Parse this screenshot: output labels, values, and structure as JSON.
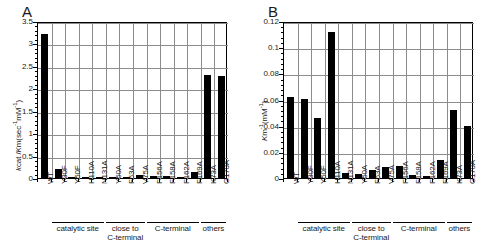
{
  "figure": {
    "panels": [
      {
        "letter": "A"
      },
      {
        "letter": "B"
      }
    ]
  },
  "chart_data": [
    {
      "type": "bar",
      "panel": "A",
      "title": "",
      "xlabel": "",
      "ylabel": "kcat /Km (sec-1 mM-1)",
      "ylabel_parts": {
        "pre_italic": "k",
        "pre_rest": "cat /",
        "mid_italic": "K",
        "mid_rest": "m (sec",
        "sup1": "-1",
        "mid2": "mM",
        "sup2": "-1",
        "tail": ")"
      },
      "ylim": [
        0,
        3.5
      ],
      "yticks": [
        "0",
        "0.5",
        "1",
        "1.5",
        "2",
        "2.5",
        "3",
        "3.5"
      ],
      "ytick_values": [
        0,
        0.5,
        1,
        1.5,
        2,
        2.5,
        3,
        3.5
      ],
      "grid": true,
      "legend": "none",
      "categories": [
        "WT",
        "Y30F",
        "Y50F",
        "H110A",
        "N131A",
        "Y50A",
        "F53A",
        "V75A",
        "F156A",
        "F158A",
        "F162A",
        "F169A",
        "K73A",
        "G170A"
      ],
      "values": [
        3.22,
        0.19,
        0.02,
        0.005,
        0.02,
        0.03,
        0.02,
        0.06,
        0.05,
        0.04,
        0.02,
        0.14,
        2.3,
        2.28
      ],
      "groups": [
        {
          "label": "catalytic site",
          "start": 1,
          "end": 4
        },
        {
          "label": "close to\nC-terminal",
          "start": 5,
          "end": 7
        },
        {
          "label": "C-terminal",
          "start": 8,
          "end": 11
        },
        {
          "label": "others",
          "start": 12,
          "end": 13
        }
      ]
    },
    {
      "type": "bar",
      "panel": "B",
      "title": "",
      "xlabel": "",
      "ylabel": "Km-1 (mM-1)",
      "ylabel_parts": {
        "italic": "K",
        "sub": "m",
        "sup1": "-1",
        "mid": "(mM",
        "sup2": "-1",
        "tail": ")"
      },
      "ylim": [
        0,
        0.12
      ],
      "yticks": [
        "0",
        "0.02",
        "0.04",
        "0.06",
        "0.08",
        "0.1",
        "0.12"
      ],
      "ytick_values": [
        0,
        0.02,
        0.04,
        0.06,
        0.08,
        0.1,
        0.12
      ],
      "grid": true,
      "legend": "none",
      "categories": [
        "WT",
        "Y30F",
        "Y50F",
        "H110A",
        "N131A",
        "Y50A",
        "F53A",
        "V75A",
        "F156A",
        "F158A",
        "F162A",
        "F169A",
        "K73A",
        "G170A"
      ],
      "values": [
        0.0622,
        0.0602,
        0.046,
        0.1118,
        0.0038,
        0.003,
        0.0062,
        0.0088,
        0.0094,
        0.0022,
        0.0018,
        0.0136,
        0.0518,
        0.04
      ],
      "groups": [
        {
          "label": "catalytic site",
          "start": 1,
          "end": 4
        },
        {
          "label": "close to\nC-terminal",
          "start": 5,
          "end": 7
        },
        {
          "label": "C-terminal",
          "start": 8,
          "end": 11
        },
        {
          "label": "others",
          "start": 12,
          "end": 13
        }
      ]
    }
  ],
  "colors": {
    "bar": "#000000",
    "grid": "#8c8c8c",
    "axis": "#000000",
    "background": "#ffffff"
  }
}
